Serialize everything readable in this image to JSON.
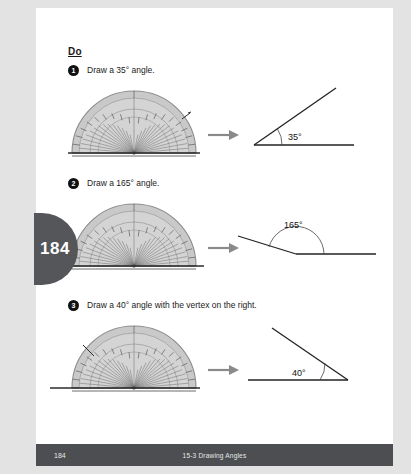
{
  "page": {
    "tab_number": "184",
    "background_color": "#e3e3e3",
    "page_color": "#ffffff",
    "tab_color": "#55565a"
  },
  "heading": {
    "label": "Do"
  },
  "exercises": [
    {
      "number": "1",
      "text": "Draw a 35° angle.",
      "angle_value": 35,
      "angle_label": "35°",
      "vertex_side": "left",
      "protractor_mark_degrees": 35
    },
    {
      "number": "2",
      "text": "Draw a 165° angle.",
      "angle_value": 165,
      "angle_label": "165°",
      "vertex_side": "left",
      "protractor_mark_degrees": 165
    },
    {
      "number": "3",
      "text": "Draw a 40° angle with the vertex on the right.",
      "angle_value": 40,
      "angle_label": "40°",
      "vertex_side": "right",
      "protractor_mark_degrees": 140
    }
  ],
  "arrow": {
    "icon": "arrow-right-icon",
    "color": "#8a8a8a"
  },
  "protractor": {
    "body_color": "#c9c9c9",
    "edge_color": "#8f8f8f",
    "tick_color": "#555555",
    "baseline_color": "#2b2b2b"
  },
  "footer": {
    "page_number": "184",
    "lesson_title": "15-3 Drawing Angles",
    "background_color": "#4d4e52",
    "text_color": "#e8e8e8"
  }
}
